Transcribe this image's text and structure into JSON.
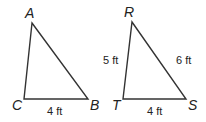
{
  "diagram": {
    "triangles": [
      {
        "name": "ABC",
        "vertices": {
          "A": {
            "label": "A",
            "x": 32,
            "y": 23
          },
          "B": {
            "label": "B",
            "x": 88,
            "y": 99
          },
          "C": {
            "label": "C",
            "x": 24,
            "y": 99
          }
        },
        "sides": {
          "CB": "4 ft"
        }
      },
      {
        "name": "RST",
        "vertices": {
          "R": {
            "label": "R",
            "x": 132,
            "y": 22
          },
          "S": {
            "label": "S",
            "x": 186,
            "y": 99
          },
          "T": {
            "label": "T",
            "x": 123,
            "y": 99
          }
        },
        "sides": {
          "RT": "5 ft",
          "RS": "6 ft",
          "TS": "4 ft"
        }
      }
    ]
  }
}
